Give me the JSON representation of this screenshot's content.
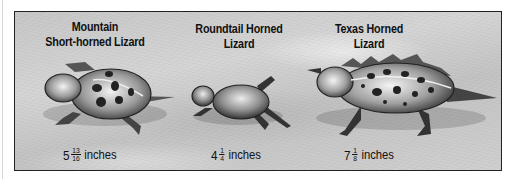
{
  "figure": {
    "lizards": [
      {
        "name_line1": "Mountain",
        "name_line2": "Short-horned Lizard",
        "size_whole": "5",
        "size_num": "13",
        "size_den": "16",
        "size_unit": "inches"
      },
      {
        "name_line1": "Roundtail Horned Lizard",
        "size_whole": "4",
        "size_num": "1",
        "size_den": "4",
        "size_unit": "inches"
      },
      {
        "name_line1": "Texas Horned Lizard",
        "size_whole": "7",
        "size_num": "1",
        "size_den": "8",
        "size_unit": "inches"
      }
    ],
    "colors": {
      "frame_border": "#222222",
      "background": "#c8c8c8",
      "text": "#111111"
    }
  }
}
